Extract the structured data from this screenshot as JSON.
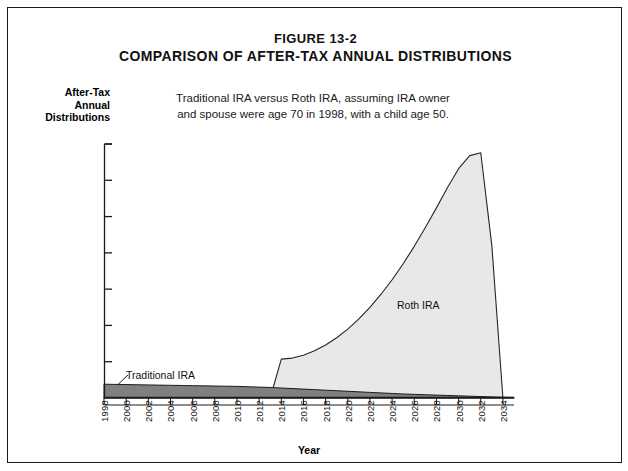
{
  "figure": {
    "number": "FIGURE 13-2",
    "title": "COMPARISON OF AFTER-TAX ANNUAL DISTRIBUTIONS",
    "subtitle_line1": "Traditional IRA versus Roth IRA, assuming IRA owner",
    "subtitle_line2": "and spouse were age 70 in 1998, with a child age 50."
  },
  "axes": {
    "y_title_line1": "After-Tax",
    "y_title_line2": "Annual",
    "y_title_line3": "Distributions",
    "x_title": "Year"
  },
  "colors": {
    "roth_fill": "#e8e8e8",
    "roth_stroke": "#262626",
    "traditional_fill": "#808080",
    "traditional_stroke": "#1a1a1a",
    "axis": "#1a1a1a",
    "border": "#1a1a1a"
  },
  "chart_data": {
    "type": "area",
    "title": "COMPARISON OF AFTER-TAX ANNUAL DISTRIBUTIONS",
    "subtitle": "Traditional IRA versus Roth IRA, assuming IRA owner and spouse were age 70 in 1998, with a child age 50.",
    "xlabel": "Year",
    "ylabel": "After-Tax Annual Distributions",
    "grid": false,
    "legend": "inline-annotations",
    "xlim": [
      1998,
      2035
    ],
    "ylim": [
      0,
      700000
    ],
    "y_ticks": [
      100000,
      200000,
      300000,
      400000,
      500000,
      600000,
      700000
    ],
    "y_tick_labels": [
      "$100,000",
      "$200,000",
      "$300,000",
      "$400,000",
      "$500,000",
      "$600,000",
      "$700,000"
    ],
    "x_ticks": [
      1998,
      2000,
      2002,
      2004,
      2006,
      2008,
      2010,
      2012,
      2014,
      2016,
      2018,
      2020,
      2022,
      2024,
      2026,
      2028,
      2030,
      2032,
      2034
    ],
    "x_tick_labels": [
      "1998",
      "2000",
      "2002",
      "2004",
      "2006",
      "2008",
      "2010",
      "2012",
      "2014",
      "2016",
      "2018",
      "2020",
      "2022",
      "2024",
      "2026",
      "2028",
      "2030",
      "2032",
      "2034"
    ],
    "x": [
      1998,
      1999,
      2000,
      2001,
      2002,
      2003,
      2004,
      2005,
      2006,
      2007,
      2008,
      2009,
      2010,
      2011,
      2012,
      2013,
      2014,
      2015,
      2016,
      2017,
      2018,
      2019,
      2020,
      2021,
      2022,
      2023,
      2024,
      2025,
      2026,
      2027,
      2028,
      2029,
      2030,
      2031,
      2032,
      2033,
      2034,
      2035
    ],
    "series": [
      {
        "name": "Traditional IRA",
        "values": [
          38000,
          37500,
          37000,
          36500,
          36000,
          35500,
          35000,
          34500,
          34000,
          33500,
          33000,
          32500,
          32000,
          31000,
          30000,
          29000,
          27500,
          26000,
          24500,
          23000,
          21500,
          20000,
          18500,
          17000,
          15500,
          14000,
          12500,
          11000,
          10000,
          9000,
          8000,
          7000,
          6000,
          5000,
          4000,
          3000,
          2000,
          1500
        ]
      },
      {
        "name": "Roth IRA",
        "values": [
          0,
          0,
          0,
          0,
          0,
          0,
          0,
          0,
          0,
          0,
          0,
          0,
          0,
          0,
          0,
          0,
          107000,
          110000,
          118000,
          130000,
          146000,
          166000,
          190000,
          218000,
          250000,
          286000,
          326000,
          370000,
          418000,
          470000,
          524000,
          580000,
          632000,
          668000,
          676000,
          420000,
          0,
          0
        ]
      }
    ],
    "annotations": [
      {
        "text": "Traditional IRA",
        "x": 2001,
        "y": 62000
      },
      {
        "text": "Roth IRA",
        "x": 2029,
        "y": 262000
      }
    ]
  }
}
